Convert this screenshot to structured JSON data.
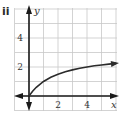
{
  "panel": {
    "label": "ii"
  },
  "chart_data": {
    "type": "line",
    "title": "",
    "xlabel": "x",
    "ylabel": "y",
    "xlim": [
      -0.8,
      6
    ],
    "ylim": [
      -0.8,
      6
    ],
    "grid": true,
    "legend": null,
    "x_ticks": [
      2,
      4
    ],
    "y_ticks": [
      2,
      4
    ],
    "x_tick_labels": [
      "2",
      "4"
    ],
    "y_tick_labels": [
      "2",
      "4"
    ],
    "series": [
      {
        "name": "curve",
        "x": [
          0,
          0.25,
          0.5,
          1,
          1.5,
          2,
          2.5,
          3,
          3.5,
          4,
          4.5,
          5,
          5.5,
          6
        ],
        "y": [
          0,
          0.33,
          0.6,
          1.0,
          1.29,
          1.5,
          1.67,
          1.8,
          1.91,
          2.0,
          2.08,
          2.14,
          2.2,
          2.25
        ],
        "end_arrow": true
      }
    ],
    "annotations": [
      "arrowheads on both ends of x-axis and y-axis",
      "curve starts at origin and ends with arrow"
    ]
  },
  "colors": {
    "axis": "#1a1a1a",
    "grid": "#c8c8c8",
    "curve": "#2b2b2b",
    "text": "#333333"
  }
}
